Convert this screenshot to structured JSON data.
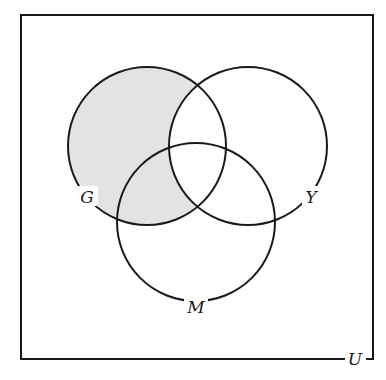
{
  "diagram": {
    "type": "venn",
    "universe_label": "U",
    "sets": [
      {
        "label": "G",
        "cx": 147,
        "cy": 146,
        "r": 79,
        "label_x": 87,
        "label_y": 203
      },
      {
        "label": "Y",
        "cx": 248,
        "cy": 146,
        "r": 79,
        "label_x": 311,
        "label_y": 203
      },
      {
        "label": "M",
        "cx": 196,
        "cy": 222,
        "r": 79,
        "label_x": 196,
        "label_y": 313
      }
    ],
    "shaded_region": "G ∩ Y'",
    "shade_color": "#e3e3e3",
    "line_color": "#1a1a1a",
    "box": {
      "x": 21,
      "y": 15,
      "width": 352,
      "height": 344
    }
  }
}
